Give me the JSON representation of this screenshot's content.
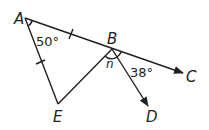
{
  "diagram": {
    "points": {
      "A": {
        "label": "A"
      },
      "B": {
        "label": "B"
      },
      "C": {
        "label": "C"
      },
      "D": {
        "label": "D"
      },
      "E": {
        "label": "E"
      }
    },
    "angles": {
      "A": "50°",
      "CBD": "38°",
      "EBD": "n"
    },
    "segments": [
      "AB",
      "AE",
      "BE",
      "BC (ray)",
      "BD (ray)"
    ],
    "congruent_marks": [
      "AB",
      "AE"
    ],
    "color": "#231f20"
  }
}
